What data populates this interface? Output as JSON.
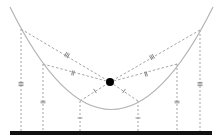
{
  "diagram": {
    "width": 222,
    "height": 139,
    "colors": {
      "curve": "#b5b5b5",
      "dashed": "#9a9a9a",
      "ground": "#111111",
      "focus": "#000000",
      "tick": "#777777"
    },
    "ground": {
      "x1": 10,
      "x2": 212,
      "y": 133,
      "thickness": 4
    },
    "curve": {
      "start": [
        10,
        7
      ],
      "control": [
        111,
        212
      ],
      "end": [
        213,
        7
      ]
    },
    "focus_point": {
      "cx": 110,
      "cy": 82,
      "r": 4
    },
    "curve_points": [
      {
        "id": "P1",
        "x": 21,
        "y": 29,
        "tick_label": "III"
      },
      {
        "id": "P2",
        "x": 43,
        "y": 64,
        "tick_label": "II"
      },
      {
        "id": "P3",
        "x": 80,
        "y": 101,
        "tick_label": "I"
      },
      {
        "id": "P4",
        "x": 138,
        "y": 101,
        "tick_label": "I"
      },
      {
        "id": "P5",
        "x": 177,
        "y": 64,
        "tick_label": "II"
      },
      {
        "id": "P6",
        "x": 200,
        "y": 30,
        "tick_label": "III"
      }
    ],
    "segment_ticks": [
      {
        "from": "P1",
        "to": "focus",
        "label": "III",
        "at": [
          67,
          55
        ]
      },
      {
        "from": "P2",
        "to": "focus",
        "label": "II",
        "at": [
          73,
          73
        ]
      },
      {
        "from": "P3",
        "to": "focus",
        "label": "I",
        "at": [
          95,
          91
        ]
      },
      {
        "from": "P4",
        "to": "focus",
        "label": "I",
        "at": [
          124,
          91
        ]
      },
      {
        "from": "P5",
        "to": "focus",
        "label": "II",
        "at": [
          146,
          74
        ]
      },
      {
        "from": "P6",
        "to": "focus",
        "label": "III",
        "at": [
          152,
          57
        ]
      }
    ],
    "vertical_ticks": [
      {
        "x": 21,
        "y": 84,
        "label": "III"
      },
      {
        "x": 43,
        "y": 102,
        "label": "II"
      },
      {
        "x": 80,
        "y": 118,
        "label": "I"
      },
      {
        "x": 138,
        "y": 118,
        "label": "I"
      },
      {
        "x": 177,
        "y": 102,
        "label": "II"
      },
      {
        "x": 200,
        "y": 84,
        "label": "III"
      }
    ]
  }
}
